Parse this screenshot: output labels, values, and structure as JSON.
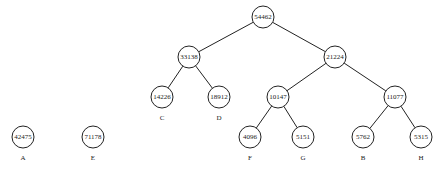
{
  "diagram": {
    "type": "huffman-tree",
    "nodes": [
      {
        "id": "n54462",
        "value": "54462",
        "x": 263,
        "y": 17,
        "label": ""
      },
      {
        "id": "n33138",
        "value": "33138",
        "x": 189,
        "y": 57,
        "label": ""
      },
      {
        "id": "n21224",
        "value": "21224",
        "x": 335,
        "y": 57,
        "label": ""
      },
      {
        "id": "n14226",
        "value": "14226",
        "x": 162,
        "y": 97,
        "label": "C"
      },
      {
        "id": "n18912",
        "value": "18912",
        "x": 219,
        "y": 97,
        "label": "D"
      },
      {
        "id": "n10147",
        "value": "10147",
        "x": 278,
        "y": 97,
        "label": ""
      },
      {
        "id": "n11077",
        "value": "11077",
        "x": 395,
        "y": 97,
        "label": ""
      },
      {
        "id": "n4096",
        "value": "4096",
        "x": 250,
        "y": 137,
        "label": "F"
      },
      {
        "id": "n5151",
        "value": "5151",
        "x": 303,
        "y": 137,
        "label": "G"
      },
      {
        "id": "n5762",
        "value": "5762",
        "x": 363,
        "y": 137,
        "label": "B"
      },
      {
        "id": "n5315",
        "value": "5315",
        "x": 421,
        "y": 137,
        "label": "H"
      },
      {
        "id": "n42475",
        "value": "42475",
        "x": 23,
        "y": 137,
        "label": "A"
      },
      {
        "id": "n71178",
        "value": "71178",
        "x": 93,
        "y": 137,
        "label": "E"
      }
    ],
    "edges": [
      [
        "n54462",
        "n33138"
      ],
      [
        "n54462",
        "n21224"
      ],
      [
        "n33138",
        "n14226"
      ],
      [
        "n33138",
        "n18912"
      ],
      [
        "n21224",
        "n10147"
      ],
      [
        "n21224",
        "n11077"
      ],
      [
        "n10147",
        "n4096"
      ],
      [
        "n10147",
        "n5151"
      ],
      [
        "n11077",
        "n5762"
      ],
      [
        "n11077",
        "n5315"
      ]
    ],
    "node_radius": 11,
    "label_offset": 21
  }
}
